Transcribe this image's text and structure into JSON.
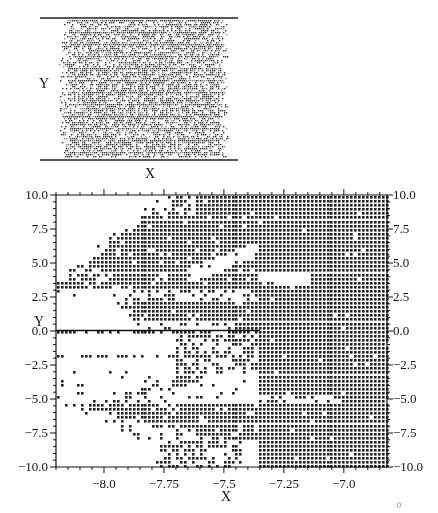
{
  "chart_data": [
    {
      "id": "inset",
      "type": "heatmap",
      "title": "",
      "xlabel": "X",
      "ylabel": "Y",
      "description": "Overview panel: dense grid of dots filling nearly the whole domain, with ragged left and right edges; horizontal boundary lines at top and bottom.",
      "grid_on": false,
      "legend": null,
      "frame": {
        "left": 40,
        "right": 238,
        "top": 18,
        "bottom": 160
      },
      "fill_region": {
        "left": 66,
        "right": 222,
        "jitter_left": 10,
        "jitter_right": 8
      }
    },
    {
      "id": "main",
      "type": "scatter",
      "title": "",
      "xlabel": "X",
      "ylabel": "Y",
      "xlim": [
        -8.2,
        -6.82
      ],
      "ylim": [
        -10.0,
        10.0
      ],
      "x_ticks": [
        -8.0,
        -7.75,
        -7.5,
        -7.25,
        -7.0
      ],
      "x_tick_labels": [
        "−8.0",
        "−7.75",
        "−7.5",
        "−7.25",
        "−7.0"
      ],
      "y_ticks": [
        10.0,
        7.5,
        5.0,
        2.5,
        0.0,
        -2.5,
        -5.0,
        -7.5,
        -10.0
      ],
      "y_tick_labels": [
        "10.0",
        "7.5",
        "5.0",
        "2.5",
        "0.0",
        "−2.5",
        "−5.0",
        "−7.5",
        "−10.0"
      ],
      "grid_on": false,
      "legend": null,
      "reference_line_y": 0.0,
      "description": "Lattice of dots (step ~0.016 in X, ~0.3 in Y) marking points of a set; fully filled for X > -7.35, with wedge-shaped filled tongues extending left and white gaps between them.",
      "regions": [
        {
          "name": "solid-right",
          "x_from": -7.35,
          "x_to": -6.82,
          "y_from": -10.0,
          "y_to": 10.0,
          "density": 0.99
        },
        {
          "name": "upper-band",
          "x_from_at_top": -7.72,
          "x_from_at_bottom": -8.2,
          "y_top": 10.0,
          "y_bottom": 3.0,
          "density": 0.93
        },
        {
          "name": "upper-gap",
          "description": "white diagonal channel from (-7.6, 4.2) to (-7.05, 8.0)",
          "points": [
            [
              -7.62,
              4.4
            ],
            [
              -7.3,
              6.0
            ],
            [
              -7.05,
              8.0
            ]
          ],
          "half_width": 0.6
        },
        {
          "name": "middle-tongue",
          "x_from": -7.9,
          "y_top": 2.0,
          "y_bottom": 0.2,
          "density": 0.85
        },
        {
          "name": "zero-line-dots",
          "x_from": -8.2,
          "x_to": -7.35,
          "y": -0.2,
          "density": 0.7
        },
        {
          "name": "minus-band-1",
          "x_from": -7.65,
          "y_top": -0.6,
          "y_bottom": -3.0,
          "density": 0.6
        },
        {
          "name": "lower-gap",
          "description": "white wedge between y=-3 and y=-5 narrowing to the right",
          "tip_x": -7.1
        },
        {
          "name": "lower-band",
          "x_from_at_top": -8.2,
          "y_top": -5.2,
          "y_bottom": -8.0,
          "density": 0.9
        },
        {
          "name": "bottom-scatter",
          "x_from": -7.75,
          "x_to": -7.45,
          "y_top": -8.0,
          "y_bottom": -10.0,
          "density": 0.55
        }
      ]
    }
  ],
  "labels": {
    "inset_y": "Y",
    "inset_x": "X",
    "main_y": "Y",
    "main_x": "X",
    "corner_artifact": "0"
  }
}
